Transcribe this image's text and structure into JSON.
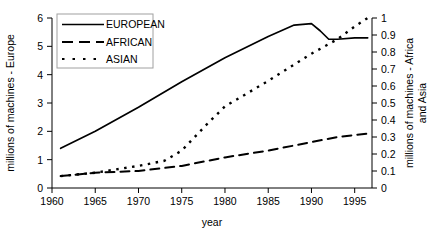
{
  "chart_data": {
    "type": "line",
    "title": "",
    "subtitle": "",
    "xlabel": "year",
    "ylabel": "millions of machines - Europe",
    "ylabel_right_line1": "millions of machines - Africa",
    "ylabel_right_line2": "and Asia",
    "xlim": [
      1960,
      1997
    ],
    "ylim": [
      0,
      6
    ],
    "ylim_right": [
      0,
      1
    ],
    "grid": false,
    "legend_position": "top-left",
    "x_ticks": [
      1960,
      1965,
      1970,
      1975,
      1980,
      1985,
      1990,
      1995
    ],
    "x_tick_labels": [
      "1960",
      "1965",
      "1970",
      "1975",
      "1980",
      "1985",
      "1990",
      "1995"
    ],
    "y_ticks_left": [
      0,
      1,
      2,
      3,
      4,
      5,
      6
    ],
    "y_tick_labels_left": [
      "0",
      "1",
      "2",
      "3",
      "4",
      "5",
      "6"
    ],
    "y_ticks_right": [
      0,
      0.1,
      0.2,
      0.3,
      0.4,
      0.5,
      0.6,
      0.7,
      0.8,
      0.9,
      1
    ],
    "y_tick_labels_right": [
      "0",
      "0.1",
      "0.2",
      "0.3",
      "0.4",
      "0.5",
      "0.6",
      "0.7",
      "0.8",
      "0.9",
      "1"
    ],
    "series": [
      {
        "name": "EUROPEAN",
        "axis": "left",
        "style": "solid",
        "x": [
          1961,
          1965,
          1970,
          1975,
          1980,
          1985,
          1988,
          1990,
          1991,
          1992,
          1993,
          1995,
          1996.5
        ],
        "values": [
          1.4,
          2.0,
          2.85,
          3.75,
          4.6,
          5.35,
          5.75,
          5.8,
          5.55,
          5.25,
          5.25,
          5.3,
          5.3
        ]
      },
      {
        "name": "AFRICAN",
        "axis": "right",
        "style": "dashed",
        "x": [
          1961,
          1965,
          1970,
          1975,
          1980,
          1985,
          1990,
          1993,
          1996.5
        ],
        "values": [
          0.07,
          0.09,
          0.1,
          0.13,
          0.18,
          0.22,
          0.27,
          0.3,
          0.32
        ]
      },
      {
        "name": "ASIAN",
        "axis": "right",
        "style": "dotted",
        "x": [
          1961,
          1965,
          1970,
          1973,
          1975,
          1978,
          1980,
          1985,
          1990,
          1993,
          1995,
          1996.5
        ],
        "values": [
          0.07,
          0.09,
          0.13,
          0.16,
          0.22,
          0.38,
          0.48,
          0.63,
          0.79,
          0.875,
          0.95,
          1.0
        ]
      }
    ]
  },
  "legend": {
    "items": [
      {
        "label": "EUROPEAN",
        "style": "solid"
      },
      {
        "label": "AFRICAN",
        "style": "dashed"
      },
      {
        "label": "ASIAN",
        "style": "dotted"
      }
    ]
  },
  "axes": {
    "x_title": "year",
    "y_left_title": "millions of machines - Europe",
    "y_right_title_line1": "millions of machines - Africa",
    "y_right_title_line2": "and Asia"
  }
}
